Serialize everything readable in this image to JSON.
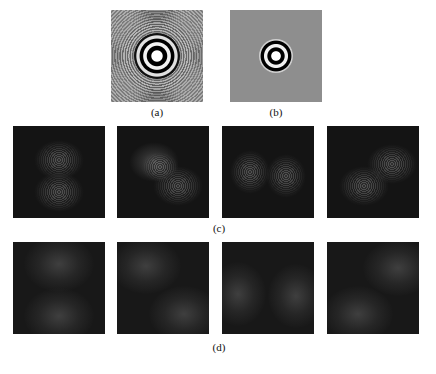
{
  "figure": {
    "top_row": {
      "panels": [
        {
          "id": "a",
          "label": "(a)",
          "description": "Point spread function with concentric fringes on gray background"
        },
        {
          "id": "b",
          "label": "(b)",
          "description": "Filtered point spread function with compact ringed core on flat gray background"
        }
      ]
    },
    "row_c": {
      "label": "(c)",
      "panels": [
        {
          "index": 1,
          "lobes": "top and bottom"
        },
        {
          "index": 2,
          "lobes": "upper-left and lower-right"
        },
        {
          "index": 3,
          "lobes": "left and right"
        },
        {
          "index": 4,
          "lobes": "upper-right and lower-left"
        }
      ]
    },
    "row_d": {
      "label": "(d)",
      "panels": [
        {
          "index": 1,
          "lobes": "top and bottom"
        },
        {
          "index": 2,
          "lobes": "upper-left and lower-right"
        },
        {
          "index": 3,
          "lobes": "left and right"
        },
        {
          "index": 4,
          "lobes": "upper-right and lower-left"
        }
      ]
    },
    "colors": {
      "page_background": "#ffffff",
      "gray_panel": "#8e8e8e",
      "dark_panel": "#141414"
    }
  }
}
